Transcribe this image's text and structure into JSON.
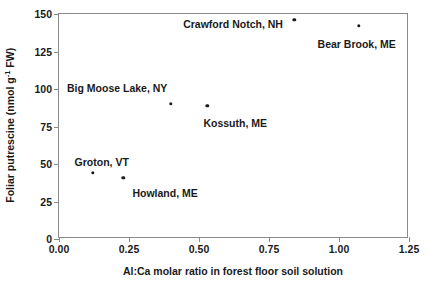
{
  "chart_data": {
    "type": "scatter",
    "title": "",
    "xlabel": "Al:Ca molar ratio in forest floor soil solution",
    "ylabel": "Foliar putrescine (nmol g⁻¹ FW)",
    "ylabel_parts": {
      "pre": "Foliar putrescine (nmol g",
      "sup": "-1",
      "post": " FW)"
    },
    "xlim": [
      0.0,
      1.25
    ],
    "ylim": [
      0,
      150
    ],
    "xticks": [
      0.0,
      0.25,
      0.5,
      0.75,
      1.0,
      1.25
    ],
    "xtick_labels": [
      "0.00",
      "0.25",
      "0.50",
      "0.75",
      "1.00",
      "1.25"
    ],
    "yticks": [
      0,
      25,
      50,
      75,
      100,
      125,
      150
    ],
    "ytick_labels": [
      "0",
      "25",
      "50",
      "75",
      "100",
      "125",
      "150"
    ],
    "grid": false,
    "legend": "none",
    "marker": "filled-circle",
    "marker_color": "#1a1a1a",
    "points": [
      {
        "label": "Groton, VT",
        "x": 0.12,
        "y": 44,
        "label_dx": -18,
        "label_dy": -16,
        "label_align": "left"
      },
      {
        "label": "Howland, ME",
        "x": 0.23,
        "y": 41,
        "label_dx": 9,
        "label_dy": 10,
        "label_align": "left"
      },
      {
        "label": "Big Moose Lake, NY",
        "x": 0.4,
        "y": 90,
        "label_dx": -104,
        "label_dy": -21,
        "label_align": "left"
      },
      {
        "label": "Kossuth, ME",
        "x": 0.53,
        "y": 89,
        "label_dx": -4,
        "label_dy": 12,
        "label_align": "left"
      },
      {
        "label": "Crawford Notch, NH",
        "x": 0.84,
        "y": 146,
        "label_dx": -111,
        "label_dy": -1,
        "label_align": "left"
      },
      {
        "label": "Bear Brook, ME",
        "x": 1.07,
        "y": 142,
        "label_dx": -41,
        "label_dy": 13,
        "label_align": "left"
      }
    ]
  },
  "figure": {
    "background_color": "#ffffff",
    "axis_color": "#8a8a8a",
    "text_color": "#1a1a1a"
  }
}
